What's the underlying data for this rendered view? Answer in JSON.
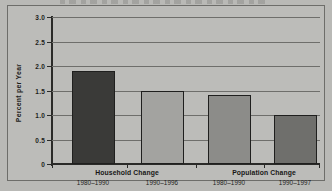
{
  "chart_data": {
    "type": "bar",
    "title": "",
    "xlabel": "",
    "ylabel": "Percent per Year",
    "ylim": [
      0,
      3.0
    ],
    "yticks": [
      "0",
      "0.5",
      "1.0",
      "1.5",
      "2.0",
      "2.5",
      "3.0"
    ],
    "ytick_values": [
      0,
      0.5,
      1.0,
      1.5,
      2.0,
      2.5,
      3.0
    ],
    "grid": true,
    "legend": "none",
    "categories": [
      "1980–1990",
      "1990–1996",
      "1980–1990",
      "1990–1997"
    ],
    "values": [
      1.9,
      1.5,
      1.4,
      1.0
    ],
    "bar_colors": [
      "#3a3a38",
      "#a3a3a0",
      "#8c8c89",
      "#6f6f6c"
    ],
    "groups": [
      {
        "label": "Household Change",
        "categories": [
          "1980–1990",
          "1990–1996"
        ],
        "values": [
          1.9,
          1.5
        ]
      },
      {
        "label": "Population Change",
        "categories": [
          "1980–1990",
          "1990–1997"
        ],
        "values": [
          1.4,
          1.0
        ]
      }
    ],
    "bars": [
      {
        "group": "Household Change",
        "period": "1980–1990",
        "value": 1.9,
        "color": "#3a3a38"
      },
      {
        "group": "Household Change",
        "period": "1990–1996",
        "value": 1.5,
        "color": "#a3a3a0"
      },
      {
        "group": "Population Change",
        "period": "1980–1990",
        "value": 1.4,
        "color": "#8c8c89"
      },
      {
        "group": "Population Change",
        "period": "1990–1997",
        "value": 1.0,
        "color": "#6f6f6c"
      }
    ]
  },
  "figure": {
    "background_color": "#b9b9b6",
    "border_color": "#6d6d6a",
    "axis_color": "#2a2a28",
    "grid_color": "#6e6e6b",
    "text_color": "#1d1d1b"
  }
}
